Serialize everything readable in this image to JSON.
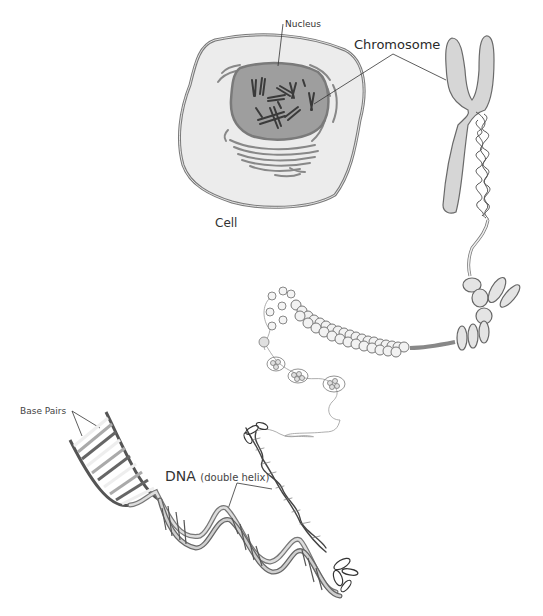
{
  "diagram": {
    "labels": {
      "nucleus": "Nucleus",
      "chromosome": "Chromosome",
      "cell": "Cell",
      "base_pairs": "Base Pairs",
      "dna": "DNA",
      "dna_sub": "(double helix)"
    },
    "colors": {
      "cell_fill": "#ececec",
      "cell_stroke": "#7a7a7a",
      "nucleus_fill": "#9e9e9e",
      "chromosome_fill": "#d6d6d6",
      "strand": "#555555",
      "leader_line": "#333333"
    },
    "nodes": [
      {
        "id": "cell",
        "label": "Cell"
      },
      {
        "id": "nucleus",
        "label": "Nucleus"
      },
      {
        "id": "chromosome",
        "label": "Chromosome"
      },
      {
        "id": "chromatin-fiber",
        "label": ""
      },
      {
        "id": "nucleosomes",
        "label": ""
      },
      {
        "id": "dna",
        "label": "DNA (double helix)"
      },
      {
        "id": "base-pairs",
        "label": "Base Pairs"
      }
    ],
    "edges": [
      {
        "from": "cell",
        "to": "nucleus"
      },
      {
        "from": "nucleus",
        "to": "chromosome"
      },
      {
        "from": "chromosome",
        "to": "chromatin-fiber"
      },
      {
        "from": "chromatin-fiber",
        "to": "nucleosomes"
      },
      {
        "from": "nucleosomes",
        "to": "dna"
      },
      {
        "from": "dna",
        "to": "base-pairs"
      }
    ]
  }
}
